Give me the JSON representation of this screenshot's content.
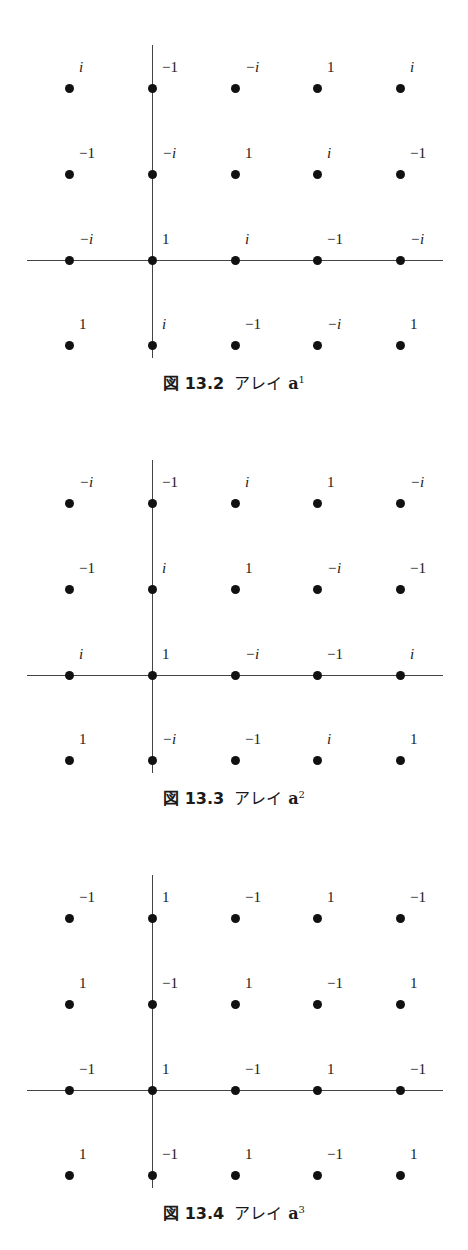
{
  "figures": [
    {
      "caption": {
        "number": "図 13.2",
        "title": "アレイ",
        "var": "a",
        "exp": "1"
      },
      "top": 0,
      "grid": [
        [
          "i",
          "−1",
          "−i",
          "1",
          "i"
        ],
        [
          "−1",
          "−i",
          "1",
          "i",
          "−1"
        ],
        [
          "−i",
          "1",
          "i",
          "−1",
          "−i"
        ],
        [
          "1",
          "i",
          "−1",
          "−i",
          "1"
        ]
      ]
    },
    {
      "caption": {
        "number": "図 13.3",
        "title": "アレイ",
        "var": "a",
        "exp": "2"
      },
      "top": 415,
      "grid": [
        [
          "−i",
          "−1",
          "i",
          "1",
          "−i"
        ],
        [
          "−1",
          "i",
          "1",
          "−i",
          "−1"
        ],
        [
          "i",
          "1",
          "−i",
          "−1",
          "i"
        ],
        [
          "1",
          "−i",
          "−1",
          "i",
          "1"
        ]
      ]
    },
    {
      "caption": {
        "number": "図 13.4",
        "title": "アレイ",
        "var": "a",
        "exp": "3"
      },
      "top": 830,
      "grid": [
        [
          "−1",
          "1",
          "−1",
          "1",
          "−1"
        ],
        [
          "1",
          "−1",
          "1",
          "−1",
          "1"
        ],
        [
          "−1",
          "1",
          "−1",
          "1",
          "−1"
        ],
        [
          "1",
          "−1",
          "1",
          "−1",
          "1"
        ]
      ]
    }
  ]
}
